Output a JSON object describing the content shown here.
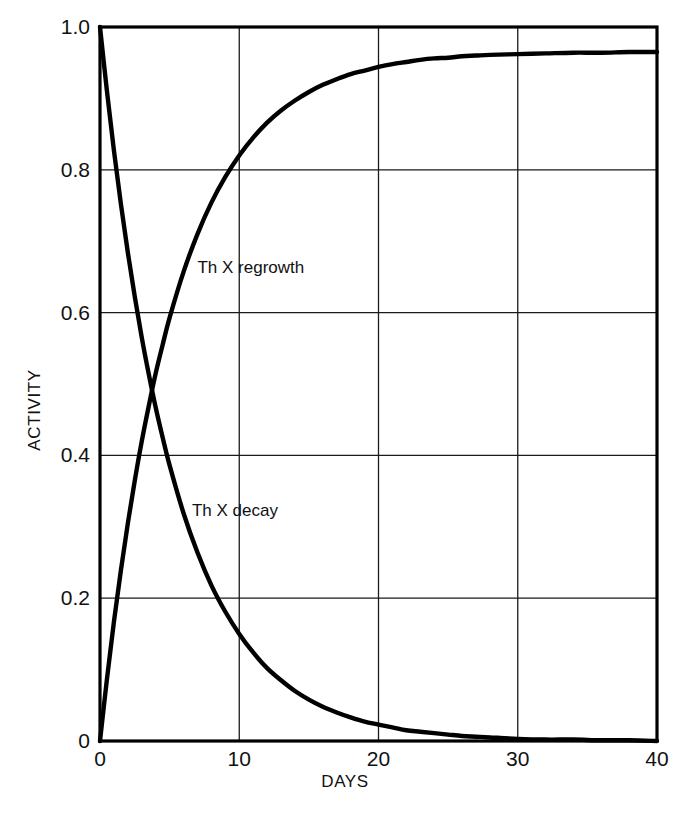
{
  "chart_data": {
    "type": "line",
    "title": "",
    "xlabel": "DAYS",
    "ylabel": "ACTIVITY",
    "xlim": [
      0,
      40
    ],
    "ylim": [
      0,
      1.0
    ],
    "grid": true,
    "legend": "inline-labels",
    "x_ticks": [
      "0",
      "10",
      "20",
      "30",
      "40"
    ],
    "x_tick_values": [
      0,
      10,
      20,
      30,
      40
    ],
    "y_ticks": [
      "0",
      "0.2",
      "0.4",
      "0.6",
      "0.8",
      "1.0"
    ],
    "y_tick_values": [
      0,
      0.2,
      0.4,
      0.6,
      0.8,
      1.0
    ],
    "annotations": [
      {
        "text": "Th X regrowth",
        "x": 7.0,
        "y": 0.655
      },
      {
        "text": "Th X decay",
        "x": 6.6,
        "y": 0.315
      }
    ],
    "series": [
      {
        "name": "Th X decay",
        "label": "Th X decay",
        "half_life_days": 3.64,
        "x": [
          0,
          0.5,
          1,
          1.5,
          2,
          2.5,
          3,
          3.5,
          4,
          4.5,
          5,
          6,
          7,
          8,
          9,
          10,
          11,
          12,
          13,
          14,
          15,
          16,
          17,
          18,
          19,
          20,
          21,
          22,
          23,
          24,
          25,
          26,
          27,
          28,
          30,
          32,
          34,
          36,
          38,
          40
        ],
        "y": [
          1.0,
          0.91,
          0.827,
          0.752,
          0.684,
          0.622,
          0.565,
          0.514,
          0.467,
          0.425,
          0.386,
          0.319,
          0.264,
          0.218,
          0.181,
          0.15,
          0.124,
          0.102,
          0.085,
          0.07,
          0.058,
          0.048,
          0.04,
          0.033,
          0.027,
          0.023,
          0.019,
          0.015,
          0.013,
          0.011,
          0.009,
          0.007,
          0.006,
          0.005,
          0.003,
          0.002,
          0.002,
          0.001,
          0.001,
          0.0
        ]
      },
      {
        "name": "Th X regrowth",
        "label": "Th X regrowth",
        "plateau": 0.965,
        "half_life_days": 3.64,
        "x": [
          0,
          0.5,
          1,
          1.5,
          2,
          2.5,
          3,
          3.5,
          4,
          4.5,
          5,
          6,
          7,
          8,
          9,
          10,
          11,
          12,
          13,
          14,
          15,
          16,
          17,
          18,
          19,
          20,
          21,
          22,
          23,
          24,
          25,
          26,
          27,
          28,
          30,
          32,
          34,
          36,
          38,
          40
        ],
        "y": [
          0.0,
          0.087,
          0.167,
          0.239,
          0.305,
          0.365,
          0.42,
          0.469,
          0.515,
          0.555,
          0.593,
          0.657,
          0.71,
          0.754,
          0.79,
          0.82,
          0.845,
          0.866,
          0.883,
          0.897,
          0.909,
          0.919,
          0.927,
          0.934,
          0.939,
          0.944,
          0.948,
          0.951,
          0.954,
          0.956,
          0.957,
          0.959,
          0.96,
          0.961,
          0.962,
          0.963,
          0.964,
          0.964,
          0.965,
          0.965
        ]
      }
    ]
  },
  "axes": {
    "y_title": "ACTIVITY",
    "x_title": "DAYS"
  },
  "colors": {
    "curve": "#000000",
    "grid": "#1a1a1a",
    "frame": "#000000",
    "background": "#ffffff"
  }
}
